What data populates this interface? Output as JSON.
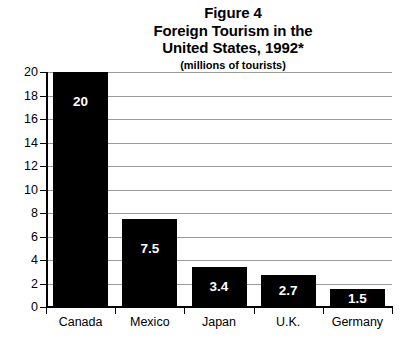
{
  "title": {
    "line1": "Figure 4",
    "line2": "Foreign Tourism in the",
    "line3": "United States, 1992*",
    "subtitle": "(millions of tourists)"
  },
  "chart_data": {
    "type": "bar",
    "title": "Figure 4 Foreign Tourism in the United States, 1992*",
    "subtitle": "(millions of tourists)",
    "xlabel": "",
    "ylabel": "",
    "ylim": [
      0,
      20
    ],
    "ytick_step": 2,
    "yticks": [
      "20",
      "18",
      "16",
      "14",
      "12",
      "10",
      "8",
      "6",
      "4",
      "2",
      "0"
    ],
    "grid": true,
    "grid_axis": "y",
    "legend": false,
    "bar_color": "#000000",
    "value_label_color": "#ffffff",
    "gridline_color": "#9a9a9a",
    "categories": [
      "Canada",
      "Mexico",
      "Japan",
      "U.K.",
      "Germany"
    ],
    "values": [
      20,
      7.5,
      3.4,
      2.7,
      1.5
    ],
    "value_labels": [
      "20",
      "7.5",
      "3.4",
      "2.7",
      "1.5"
    ]
  }
}
